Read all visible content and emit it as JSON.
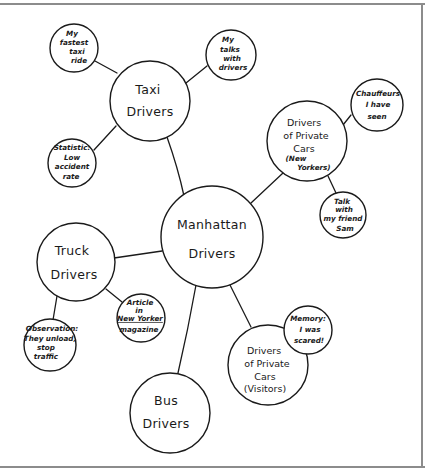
{
  "diagram": {
    "type": "cluster-map",
    "style": "hand-drawn",
    "central": {
      "id": "manhattan",
      "lines": [
        "Manhattan",
        "Drivers"
      ]
    },
    "nodes": [
      {
        "id": "taxi",
        "lines": [
          "Taxi",
          "Drivers"
        ],
        "parent": "manhattan"
      },
      {
        "id": "fastest",
        "lines": [
          "My",
          "fastest",
          "taxi",
          "ride"
        ],
        "parent": "taxi"
      },
      {
        "id": "talks",
        "lines": [
          "My",
          "talks",
          "with",
          "drivers"
        ],
        "parent": "taxi"
      },
      {
        "id": "statistic",
        "lines": [
          "Statistic:",
          "Low",
          "accident",
          "rate"
        ],
        "parent": "taxi"
      },
      {
        "id": "private_ny",
        "lines": [
          "Drivers",
          "of Private",
          "Cars",
          "(New",
          "Yorkers)"
        ],
        "parent": "manhattan"
      },
      {
        "id": "chauffeurs",
        "lines": [
          "Chauffeurs",
          "I have",
          "seen"
        ],
        "parent": "private_ny"
      },
      {
        "id": "friend",
        "lines": [
          "Talk",
          "with",
          "my friend",
          "Sam"
        ],
        "parent": "private_ny"
      },
      {
        "id": "truck",
        "lines": [
          "Truck",
          "Drivers"
        ],
        "parent": "manhattan"
      },
      {
        "id": "observation",
        "lines": [
          "Observation:",
          "They unload,",
          "stop",
          "traffic"
        ],
        "parent": "truck"
      },
      {
        "id": "article",
        "lines": [
          "Article",
          "in",
          "New Yorker",
          "magazine"
        ],
        "parent": "truck"
      },
      {
        "id": "bus",
        "lines": [
          "Bus",
          "Drivers"
        ],
        "parent": "manhattan"
      },
      {
        "id": "private_visitors",
        "lines": [
          "Drivers",
          "of Private",
          "Cars",
          "(Visitors)"
        ],
        "parent": "manhattan"
      },
      {
        "id": "memory",
        "lines": [
          "Memory:",
          "I was",
          "scared!"
        ],
        "parent": "private_visitors"
      }
    ],
    "colors": {
      "ink": "#1a1a1a",
      "background": "#ffffff",
      "frame": "#8c8c8c"
    }
  }
}
